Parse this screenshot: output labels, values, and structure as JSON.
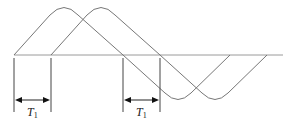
{
  "diagram": {
    "colors": {
      "curve": "#777777",
      "axis": "#999999",
      "marker": "#333333",
      "text": "#222222"
    },
    "waveforms": [
      {
        "name": "waveform-1",
        "start_x": 14,
        "end_x": 230
      },
      {
        "name": "waveform-2",
        "start_x": 51,
        "end_x": 267
      }
    ],
    "intervals": [
      {
        "label_main": "T",
        "label_sub": "1",
        "x1": 14,
        "x2": 51
      },
      {
        "label_main": "T",
        "label_sub": "1",
        "x1": 123,
        "x2": 160
      }
    ]
  }
}
